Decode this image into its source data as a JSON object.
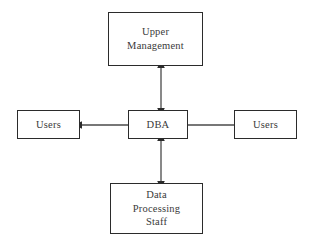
{
  "diagram": {
    "background_color": "#ffffff",
    "line_color": "#4a4a4a",
    "border_color": "#2b2b2b",
    "text_color": "#3a3a3a",
    "nodes": [
      {
        "id": "upper_management",
        "label": "Upper\nManagement"
      },
      {
        "id": "dba",
        "label": "DBA"
      },
      {
        "id": "users_left",
        "label": "Users"
      },
      {
        "id": "users_right",
        "label": "Users"
      },
      {
        "id": "data_processing",
        "label": "Data\nProcessing\nStaff"
      }
    ],
    "connectors": [
      {
        "id": "dba_upper_management",
        "from": "dba",
        "to": "upper_management",
        "direction": "bidirectional",
        "orientation": "vertical"
      },
      {
        "id": "dba_data_processing",
        "from": "dba",
        "to": "data_processing",
        "direction": "bidirectional",
        "orientation": "vertical"
      },
      {
        "id": "dba_users_left",
        "from": "dba",
        "to": "users_left",
        "direction": "left",
        "orientation": "horizontal"
      },
      {
        "id": "dba_users_right",
        "from": "dba",
        "to": "users_right",
        "direction": "right",
        "orientation": "horizontal"
      }
    ]
  }
}
